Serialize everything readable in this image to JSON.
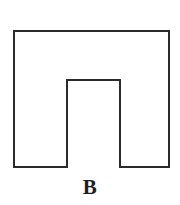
{
  "figure": {
    "label": "B",
    "shape_name": "inverted-u-polygon",
    "colors": {
      "background": "#ffffff",
      "stroke": "#2b2b2b",
      "fill": "#ffffff",
      "label": "#1f1f1f"
    },
    "stroke_width": 2,
    "canvas": {
      "width": 180,
      "height": 205
    },
    "outline_points": [
      [
        14,
        31
      ],
      [
        169,
        31
      ],
      [
        169,
        167
      ],
      [
        120,
        167
      ],
      [
        120,
        80
      ],
      [
        67,
        80
      ],
      [
        67,
        167
      ],
      [
        14,
        167
      ]
    ],
    "geometry": {
      "outer_left": 14,
      "outer_right": 169,
      "outer_top": 31,
      "outer_bottom": 167,
      "outer_width": 155,
      "outer_height": 136,
      "notch_left": 67,
      "notch_right": 120,
      "notch_top": 80,
      "notch_bottom": 167,
      "notch_width": 53,
      "notch_height": 87,
      "left_leg_width": 53,
      "right_leg_width": 49,
      "top_bar_height": 49
    }
  }
}
